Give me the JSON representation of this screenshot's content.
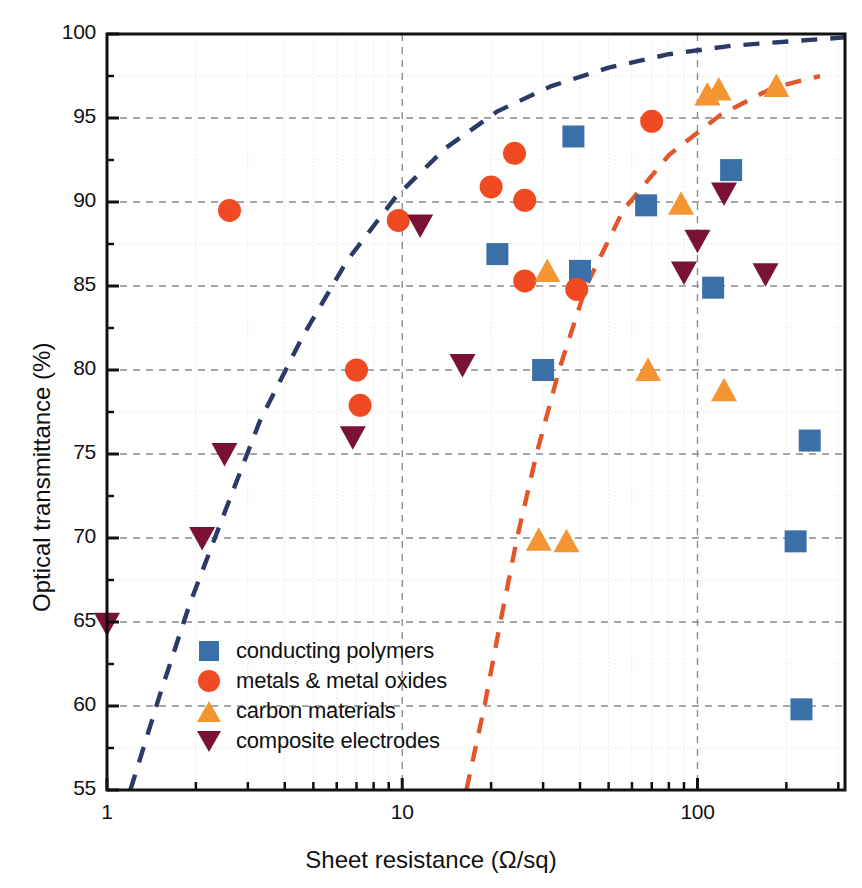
{
  "chart_data": {
    "type": "scatter",
    "title": "",
    "xlabel": "Sheet resistance (Ω/sq)",
    "ylabel": "Optical transmittance (%)",
    "xscale": "log",
    "yscale": "linear",
    "xlim": [
      1,
      316
    ],
    "ylim": [
      55,
      100
    ],
    "xticks": [
      1,
      10,
      100
    ],
    "xtick_labels": [
      "1",
      "10",
      "100"
    ],
    "yticks": [
      55,
      60,
      65,
      70,
      75,
      80,
      85,
      90,
      95,
      100
    ],
    "ytick_labels": [
      "55",
      "60",
      "65",
      "70",
      "75",
      "80",
      "85",
      "90",
      "95",
      "100"
    ],
    "minor_yticks": [
      57.5,
      62.5,
      67.5,
      72.5,
      77.5,
      82.5,
      87.5,
      92.5,
      97.5
    ],
    "grid": true,
    "grid_style": "dashed",
    "legend_position": "lower-left",
    "series": [
      {
        "name": "conducting polymers",
        "marker": "square",
        "color": "#3b6fa8",
        "points": [
          [
            21.0,
            86.9
          ],
          [
            30.0,
            80.0
          ],
          [
            38.0,
            93.9
          ],
          [
            40.0,
            85.9
          ],
          [
            67.0,
            89.8
          ],
          [
            113.0,
            84.9
          ],
          [
            130.0,
            91.9
          ],
          [
            240.0,
            75.8
          ],
          [
            215.0,
            69.8
          ],
          [
            225.0,
            59.8
          ]
        ]
      },
      {
        "name": "metals & metal oxides",
        "marker": "circle",
        "color": "#f04a23",
        "points": [
          [
            2.6,
            89.5
          ],
          [
            7.0,
            80.0
          ],
          [
            7.2,
            77.9
          ],
          [
            9.7,
            88.9
          ],
          [
            20.0,
            90.9
          ],
          [
            24.0,
            92.9
          ],
          [
            26.0,
            90.1
          ],
          [
            26.0,
            85.3
          ],
          [
            39.0,
            84.8
          ],
          [
            70.0,
            94.8
          ]
        ]
      },
      {
        "name": "carbon materials",
        "marker": "triangle-up",
        "color": "#f59432",
        "points": [
          [
            29.0,
            69.9
          ],
          [
            36.0,
            69.8
          ],
          [
            31.0,
            85.9
          ],
          [
            68.0,
            80.0
          ],
          [
            88.0,
            89.9
          ],
          [
            108.0,
            96.4
          ],
          [
            118.0,
            96.7
          ],
          [
            123.0,
            78.8
          ],
          [
            185.0,
            96.9
          ]
        ]
      },
      {
        "name": "composite electrodes",
        "marker": "triangle-down",
        "color": "#7a1233",
        "points": [
          [
            1.0,
            64.9
          ],
          [
            2.1,
            70.0
          ],
          [
            2.5,
            75.0
          ],
          [
            6.8,
            76.0
          ],
          [
            11.5,
            88.6
          ],
          [
            16.0,
            80.3
          ],
          [
            90.0,
            85.8
          ],
          [
            100.0,
            87.7
          ],
          [
            123.0,
            90.5
          ],
          [
            170.0,
            85.7
          ]
        ]
      }
    ],
    "trend_lines": [
      {
        "name": "upper-bound-curve",
        "color": "#2b3a66",
        "style": "dashed",
        "points": [
          [
            1.2,
            55.0
          ],
          [
            1.5,
            60.5
          ],
          [
            1.9,
            66.0
          ],
          [
            2.5,
            71.5
          ],
          [
            3.3,
            77.0
          ],
          [
            4.6,
            82.0
          ],
          [
            6.5,
            86.5
          ],
          [
            9.5,
            90.3
          ],
          [
            14.0,
            93.2
          ],
          [
            21.0,
            95.4
          ],
          [
            32.0,
            96.9
          ],
          [
            50.0,
            98.0
          ],
          [
            80.0,
            98.8
          ],
          [
            130.0,
            99.3
          ],
          [
            220.0,
            99.6
          ],
          [
            316.0,
            99.8
          ]
        ]
      },
      {
        "name": "lower-bound-curve",
        "color": "#e2562a",
        "style": "dashed",
        "points": [
          [
            16.5,
            55.0
          ],
          [
            19.0,
            60.0
          ],
          [
            21.5,
            65.0
          ],
          [
            24.5,
            70.0
          ],
          [
            28.5,
            75.0
          ],
          [
            34.0,
            80.0
          ],
          [
            42.0,
            85.0
          ],
          [
            56.0,
            89.5
          ],
          [
            80.0,
            92.8
          ],
          [
            120.0,
            95.2
          ],
          [
            180.0,
            96.8
          ],
          [
            260.0,
            97.5
          ]
        ]
      }
    ]
  },
  "legend": {
    "items": [
      {
        "label": "conducting polymers",
        "marker": "square",
        "color": "#3b6fa8"
      },
      {
        "label": "metals & metal oxides",
        "marker": "circle",
        "color": "#f04a23"
      },
      {
        "label": "carbon materials",
        "marker": "triangle-up",
        "color": "#f59432"
      },
      {
        "label": "composite electrodes",
        "marker": "triangle-down",
        "color": "#7a1233"
      }
    ]
  }
}
